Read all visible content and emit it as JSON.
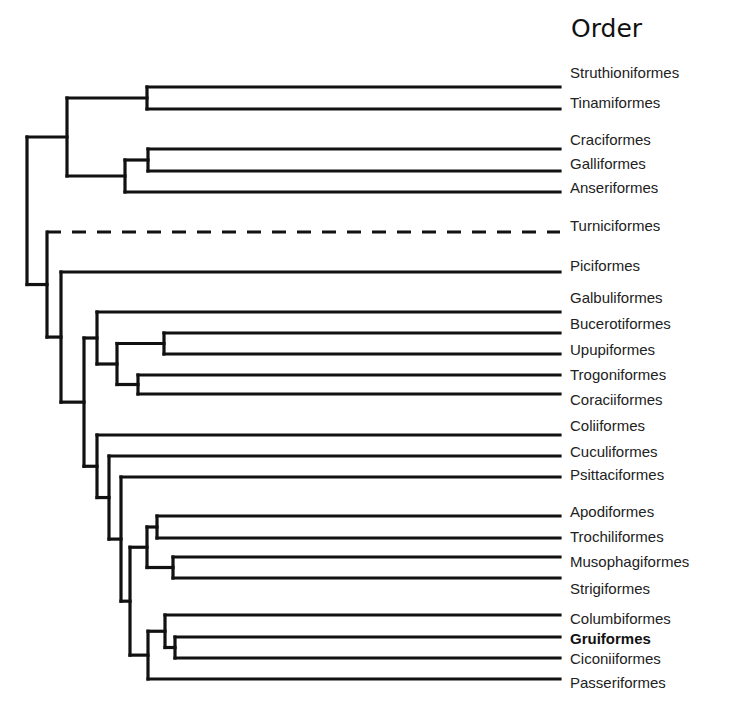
{
  "title": "Order",
  "style": {
    "line_color": "#111111",
    "background": "#ffffff"
  },
  "tips": [
    {
      "id": "struthio",
      "label": "Struthioniformes"
    },
    {
      "id": "tinami",
      "label": "Tinamiformes"
    },
    {
      "id": "craci",
      "label": "Craciformes"
    },
    {
      "id": "galli",
      "label": "Galliformes"
    },
    {
      "id": "anseri",
      "label": "Anseriformes"
    },
    {
      "id": "turnici",
      "label": "Turniciformes",
      "dashed": true
    },
    {
      "id": "pici",
      "label": "Piciformes"
    },
    {
      "id": "galbuli",
      "label": "Galbuliformes"
    },
    {
      "id": "bucero",
      "label": "Bucerotiformes"
    },
    {
      "id": "upupi",
      "label": "Upupiformes"
    },
    {
      "id": "trogoni",
      "label": "Trogoniformes"
    },
    {
      "id": "coracii",
      "label": "Coraciiformes"
    },
    {
      "id": "colii",
      "label": "Coliiformes"
    },
    {
      "id": "cuculi",
      "label": "Cuculiformes"
    },
    {
      "id": "psittaci",
      "label": "Psittaciformes"
    },
    {
      "id": "apodi",
      "label": "Apodiformes"
    },
    {
      "id": "trochili",
      "label": "Trochiliformes"
    },
    {
      "id": "musophagi",
      "label": "Musophagiformes"
    },
    {
      "id": "strigi",
      "label": "Strigiformes"
    },
    {
      "id": "columbi",
      "label": "Columbiformes"
    },
    {
      "id": "grui",
      "label": "Gruiformes",
      "bold": true
    },
    {
      "id": "ciconii",
      "label": "Ciconiiformes"
    },
    {
      "id": "passeri",
      "label": "Passeriformes"
    }
  ],
  "topology": [
    [
      [
        [
          "struthio",
          "tinami"
        ],
        [
          [
            "craci",
            "galli"
          ],
          "anseri"
        ]
      ],
      [
        "turnici",
        [
          "pici",
          [
            [
              "galbuli",
              [
                [
                  "bucero",
                  "upupi"
                ],
                [
                  "trogoni",
                  "coracii"
                ]
              ]
            ],
            [
              "colii",
              [
                "cuculi",
                [
                  "psittaci",
                  [
                    [
                      [
                        "apodi",
                        "trochili"
                      ],
                      [
                        "musophagi",
                        "strigi"
                      ]
                    ],
                    [
                      [
                        "columbi",
                        [
                          "grui",
                          "ciconii"
                        ]
                      ],
                      "passeri"
                    ]
                  ]
                ]
              ]
            ]
          ]
        ]
      ]
    ]
  ]
}
